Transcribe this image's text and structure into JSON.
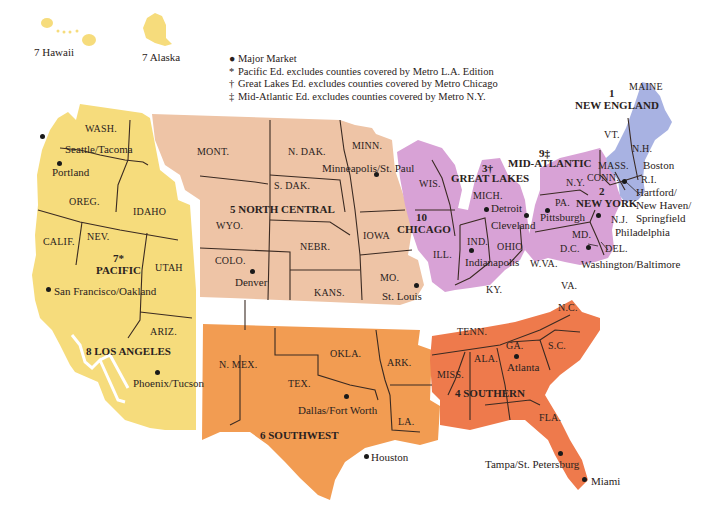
{
  "colors": {
    "pacific": "#f6dc7c",
    "los_angeles": "#f6dc7c",
    "north_central": "#eec4a6",
    "great_lakes": "#d8a2d6",
    "mid_atlantic": "#d8a2d6",
    "new_england": "#a8b2e2",
    "southern": "#ee7a4c",
    "southwest": "#f29c52",
    "border": "#3a2a22"
  },
  "insets": {
    "hawaii": "7 Hawaii",
    "alaska": "7 Alaska"
  },
  "legend": {
    "items": [
      {
        "symbol": "●",
        "text": "Major Market"
      },
      {
        "symbol": "*",
        "text": "Pacific Ed. excludes counties covered by Metro L.A. Edition"
      },
      {
        "symbol": "†",
        "text": "Great Lakes Ed. excludes counties covered by Metro Chicago"
      },
      {
        "symbol": "‡",
        "text": "Mid-Atlantic Ed. excludes counties covered by Metro N.Y."
      }
    ]
  },
  "regions": {
    "new_england": {
      "num": "1",
      "name": "NEW ENGLAND"
    },
    "new_york": {
      "num": "2",
      "name": "NEW YORK"
    },
    "great_lakes": {
      "num": "3†",
      "name": "GREAT LAKES"
    },
    "southern": {
      "name": "4 SOUTHERN"
    },
    "north_central": {
      "name": "5 NORTH CENTRAL"
    },
    "southwest": {
      "name": "6 SOUTHWEST"
    },
    "pacific": {
      "num": "7*",
      "name": "PACIFIC"
    },
    "los_angeles": {
      "name": "8 LOS ANGELES"
    },
    "mid_atlantic": {
      "num": "9‡",
      "name": "MID-ATLANTIC"
    },
    "chicago": {
      "num": "10",
      "name": "CHICAGO"
    }
  },
  "states": {
    "wash": "WASH.",
    "oreg": "OREG.",
    "idaho": "IDAHO",
    "calif": "CALIF.",
    "nev": "NEV.",
    "utah": "UTAH",
    "ariz": "ARIZ.",
    "mont": "MONT.",
    "wyo": "WYO.",
    "colo": "COLO.",
    "ndak": "N. DAK.",
    "sdak": "S. DAK.",
    "nebr": "NEBR.",
    "kans": "KANS.",
    "minn": "MINN.",
    "iowa": "IOWA",
    "mo": "MO.",
    "wis": "WIS.",
    "ill": "ILL.",
    "mich": "MICH.",
    "ind": "IND.",
    "ohio": "OHIO",
    "ky": "KY.",
    "wva": "W.VA.",
    "pa": "PA.",
    "ny": "N.Y.",
    "nj": "N.J.",
    "md": "MD.",
    "dc": "D.C.",
    "del": "DEL.",
    "conn": "CONN.",
    "mass": "MASS.",
    "ri": "R.I.",
    "vt": "VT.",
    "nh": "N.H.",
    "maine": "MAINE",
    "nmex": "N. MEX.",
    "tex": "TEX.",
    "okla": "OKLA.",
    "ark": "ARK.",
    "la": "LA.",
    "tenn": "TENN.",
    "miss": "MISS.",
    "ala": "ALA.",
    "ga": "GA.",
    "sc": "S.C.",
    "nc": "N.C.",
    "va": "VA.",
    "fla": "FLA."
  },
  "cities": {
    "seattle": "Seattle/Tacoma",
    "portland": "Portland",
    "san_francisco": "San Francisco/Oakland",
    "phoenix": "Phoenix/Tucson",
    "denver": "Denver",
    "minneapolis": "Minneapolis/St. Paul",
    "st_louis": "St. Louis",
    "dallas": "Dallas/Fort Worth",
    "houston": "Houston",
    "detroit": "Detroit",
    "cleveland": "Cleveland",
    "indianapolis": "Indianapolis",
    "pittsburgh": "Pittsburgh",
    "philadelphia": "Philadelphia",
    "washington": "Washington/Baltimore",
    "boston": "Boston",
    "hartford_1": "Hartford/",
    "hartford_2": "New Haven/",
    "hartford_3": "Springfield",
    "atlanta": "Atlanta",
    "tampa": "Tampa/St. Petersburg",
    "miami": "Miami"
  }
}
